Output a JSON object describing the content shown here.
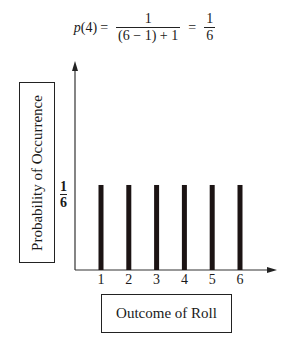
{
  "formula": {
    "lhs_func": "p",
    "lhs_arg": "(4)",
    "equals": "=",
    "frac1_num": "1",
    "frac1_den": "(6 − 1) + 1",
    "frac2_num": "1",
    "frac2_den": "6"
  },
  "axes": {
    "ylabel": "Probability of Occurrence",
    "xlabel": "Outcome of Roll",
    "ytick_num": "1",
    "ytick_den": "6",
    "xticks": [
      "1",
      "2",
      "3",
      "4",
      "5",
      "6"
    ]
  },
  "colors": {
    "bar": "#1c1414",
    "axis": "#333333"
  },
  "chart_data": {
    "type": "bar",
    "categories": [
      "1",
      "2",
      "3",
      "4",
      "5",
      "6"
    ],
    "values": [
      0.1667,
      0.1667,
      0.1667,
      0.1667,
      0.1667,
      0.1667
    ],
    "xlabel": "Outcome of Roll",
    "ylabel": "Probability of Occurrence",
    "yticks": [
      "1/6"
    ],
    "grid": false,
    "legend": null
  }
}
